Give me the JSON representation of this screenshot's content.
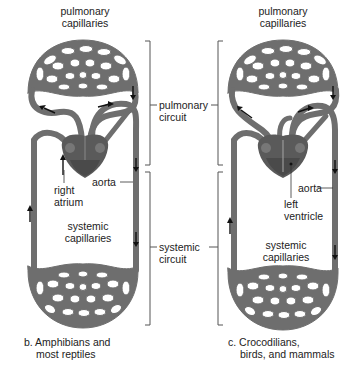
{
  "panels": [
    {
      "id": "b",
      "caption_line1": "b. Amphibians and",
      "caption_line2": "most reptiles",
      "labels": {
        "pulmonary_capillaries_1": "pulmonary",
        "pulmonary_capillaries_2": "capillaries",
        "heart_label_1": "right",
        "heart_label_2": "atrium",
        "aorta": "aorta",
        "systemic_capillaries_1": "systemic",
        "systemic_capillaries_2": "capillaries"
      }
    },
    {
      "id": "c",
      "caption_line1": "c. Crocodilians,",
      "caption_line2": "birds, and mammals",
      "labels": {
        "pulmonary_capillaries_1": "pulmonary",
        "pulmonary_capillaries_2": "capillaries",
        "aorta": "aorta",
        "heart_label_1": "left",
        "heart_label_2": "ventricle",
        "systemic_capillaries_1": "systemic",
        "systemic_capillaries_2": "capillaries"
      }
    }
  ],
  "circuits": {
    "pulmonary_1": "pulmonary",
    "pulmonary_2": "circuit",
    "systemic_1": "systemic",
    "systemic_2": "circuit"
  },
  "colors": {
    "vessel": "#6e6e6e",
    "vessel_dark": "#4a4a4a",
    "heart": "#5a5a5a",
    "arrow": "#111111",
    "bracket": "#555555",
    "text": "#222222"
  }
}
